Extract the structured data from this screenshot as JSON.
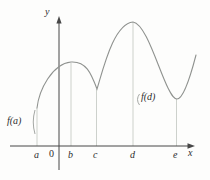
{
  "figure": {
    "y_axis_label": "y",
    "x_axis_label": "x",
    "origin_label": "0",
    "x_ticks": [
      "a",
      "b",
      "c",
      "d",
      "e"
    ],
    "annotations": {
      "f_a": "f(a)",
      "f_d": "f(d)"
    }
  },
  "colors": {
    "bg": "#fdfdfc",
    "axis": "#474747",
    "curve": "#8f928f",
    "guide": "#c7ccc6",
    "brace": "#9a9d9a",
    "text": "#2e2e2e"
  }
}
